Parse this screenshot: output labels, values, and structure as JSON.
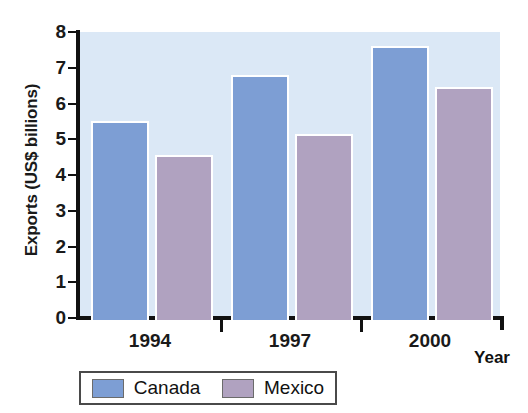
{
  "chart_data": {
    "type": "bar",
    "title": "",
    "xlabel": "Year",
    "ylabel": "Exports (US$ billions)",
    "categories": [
      "1994",
      "1997",
      "2000"
    ],
    "series": [
      {
        "name": "Canada",
        "color": "#7d9ed4",
        "values": [
          5.5,
          6.8,
          7.6
        ]
      },
      {
        "name": "Mexico",
        "color": "#b0a2c0",
        "values": [
          4.55,
          5.15,
          6.45
        ]
      }
    ],
    "ylim": [
      0,
      8
    ],
    "yticks": [
      0,
      1,
      2,
      3,
      4,
      5,
      6,
      7,
      8
    ],
    "ytick_labels": [
      "0",
      "1",
      "2",
      "3",
      "4",
      "5",
      "6",
      "7",
      "8"
    ],
    "grid": false,
    "legend_position": "bottom",
    "plot_background": "#dbe8f6"
  },
  "legend": {
    "entries": [
      {
        "label": "Canada"
      },
      {
        "label": "Mexico"
      }
    ]
  }
}
